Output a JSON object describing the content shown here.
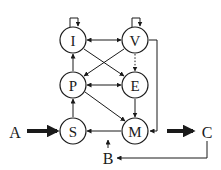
{
  "diagram": {
    "nodes": [
      {
        "id": "I",
        "label": "I",
        "x": 73,
        "y": 40
      },
      {
        "id": "V",
        "label": "V",
        "x": 135,
        "y": 40
      },
      {
        "id": "P",
        "label": "P",
        "x": 73,
        "y": 85
      },
      {
        "id": "E",
        "label": "E",
        "x": 135,
        "y": 85
      },
      {
        "id": "S",
        "label": "S",
        "x": 73,
        "y": 131
      },
      {
        "id": "M",
        "label": "M",
        "x": 135,
        "y": 131
      }
    ],
    "external": [
      {
        "id": "A",
        "label": "A",
        "x": 15,
        "y": 131
      },
      {
        "id": "B",
        "label": "B",
        "x": 108,
        "y": 158
      },
      {
        "id": "C",
        "label": "C",
        "x": 207,
        "y": 131
      }
    ],
    "edges": [
      {
        "from": "I",
        "to": "I",
        "type": "self-loop"
      },
      {
        "from": "V",
        "to": "V",
        "type": "self-loop"
      },
      {
        "from": "I",
        "to": "V",
        "type": "bidirectional"
      },
      {
        "from": "P",
        "to": "E",
        "type": "bidirectional"
      },
      {
        "from": "P",
        "to": "I",
        "type": "directed"
      },
      {
        "from": "S",
        "to": "P",
        "type": "directed"
      },
      {
        "from": "I",
        "to": "E",
        "type": "directed"
      },
      {
        "from": "V",
        "to": "P",
        "type": "directed"
      },
      {
        "from": "V",
        "to": "E",
        "type": "dotted"
      },
      {
        "from": "E",
        "to": "M",
        "type": "directed"
      },
      {
        "from": "P",
        "to": "M",
        "type": "directed"
      },
      {
        "from": "M",
        "to": "S",
        "type": "directed"
      },
      {
        "from": "V",
        "to": "M",
        "type": "elbow"
      },
      {
        "from": "A",
        "to": "S",
        "type": "thick"
      },
      {
        "from": "M",
        "to": "C",
        "type": "thick"
      },
      {
        "from": "C",
        "to": "B",
        "type": "elbow"
      },
      {
        "from": "B",
        "to": "M-S edge",
        "type": "directed"
      }
    ]
  }
}
